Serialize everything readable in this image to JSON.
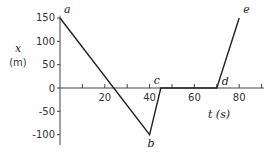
{
  "chart_data": {
    "type": "line",
    "title": "",
    "xlabel": "t (s)",
    "ylabel": "x (m)",
    "xlim": [
      0,
      90
    ],
    "ylim": [
      -125,
      160
    ],
    "grid": false,
    "x_ticks": [
      10,
      20,
      30,
      40,
      50,
      60,
      70,
      80,
      90
    ],
    "x_tick_labels": [
      "20",
      "40",
      "60",
      "80"
    ],
    "x_tick_label_values": [
      20,
      40,
      60,
      80
    ],
    "y_ticks": [
      150,
      100,
      50,
      0,
      -50,
      -100
    ],
    "y_tick_labels": [
      "150",
      "100",
      "50",
      "0",
      "-50",
      "-100"
    ],
    "series": [
      {
        "name": "position",
        "points": [
          {
            "label": "a",
            "x": 0,
            "y": 150
          },
          {
            "label": "b",
            "x": 40,
            "y": -100
          },
          {
            "label": "c",
            "x": 45,
            "y": 0
          },
          {
            "label": "d",
            "x": 70,
            "y": 0
          },
          {
            "label": "e",
            "x": 80,
            "y": 150
          }
        ]
      }
    ]
  },
  "labels": {
    "y_axis_var": "x",
    "y_axis_unit": "(m)",
    "x_axis": "t (s)"
  }
}
